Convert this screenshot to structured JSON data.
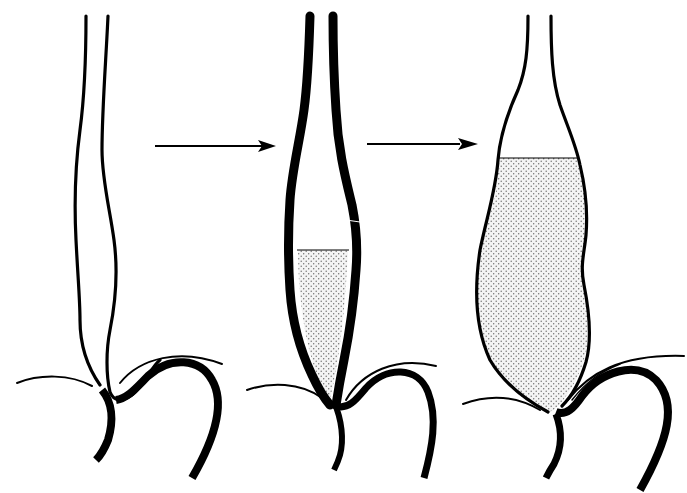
{
  "diagram": {
    "type": "sequential-anatomical-illustration",
    "background": "#ffffff",
    "ink_color": "#000000",
    "fill_pattern": "stippled-dots",
    "panels": [
      {
        "id": "stage-1",
        "description": "normal-caliber esophagus with thin walls, no contrast fill"
      },
      {
        "id": "stage-2",
        "description": "thick-walled esophagus with lower segment partially filled (stippled)"
      },
      {
        "id": "stage-3",
        "description": "dilated thin-walled esophagus largely filled (stippled) above narrowed junction"
      }
    ],
    "arrows": [
      {
        "from": "stage-1",
        "to": "stage-2"
      },
      {
        "from": "stage-2",
        "to": "stage-3"
      }
    ]
  }
}
